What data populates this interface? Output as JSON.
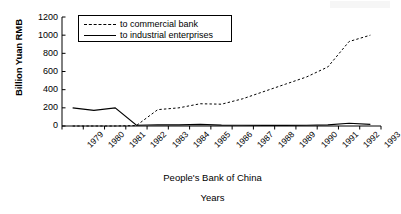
{
  "chart_data": {
    "type": "line",
    "title": "",
    "xlabel": "Years",
    "ylabel": "Billion Yuan RMB",
    "source_caption": "People's Bank of China",
    "ylim": [
      0,
      1200
    ],
    "yticks": [
      1200,
      1000,
      800,
      600,
      400,
      200,
      0
    ],
    "grid": false,
    "legend_position": "top-left-inside",
    "categories": [
      "1979",
      "1980",
      "1981",
      "1982",
      "1983",
      "1984",
      "1985",
      "1986",
      "1987",
      "1988",
      "1989",
      "1990",
      "1991",
      "1992",
      "1993"
    ],
    "series": [
      {
        "name": "to commercial bank",
        "style": "dashed",
        "color": "#000000",
        "values": [
          0,
          0,
          0,
          5,
          180,
          200,
          245,
          240,
          300,
          380,
          460,
          540,
          650,
          930,
          1000
        ]
      },
      {
        "name": "to industrial enterprises",
        "style": "solid",
        "color": "#000000",
        "values": [
          200,
          172,
          200,
          8,
          14,
          12,
          18,
          10,
          8,
          7,
          7,
          8,
          12,
          30,
          18
        ]
      }
    ]
  },
  "axis": {
    "y_title": "Billion Yuan RMB",
    "y_ticks": [
      "1200",
      "1000",
      "800",
      "600",
      "400",
      "200",
      "0"
    ],
    "x_ticks": [
      "1979",
      "1980",
      "1981",
      "1982",
      "1983",
      "1984",
      "1985",
      "1986",
      "1987",
      "1988",
      "1989",
      "1990",
      "1991",
      "1992",
      "1993"
    ]
  },
  "legend": {
    "entries": [
      {
        "label": "to commercial bank",
        "style": "dashed"
      },
      {
        "label": "to industrial enterprises",
        "style": "solid"
      }
    ]
  },
  "captions": {
    "source": "People's Bank of China",
    "x_axis": "Years"
  }
}
